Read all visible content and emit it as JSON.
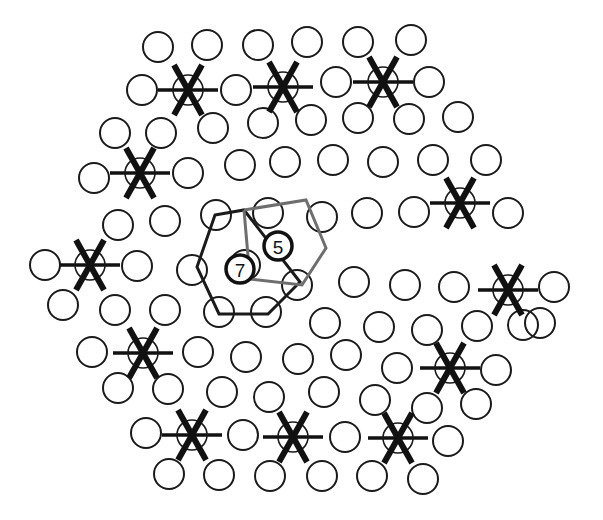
{
  "diagram": {
    "colors": {
      "background": "#ffffff",
      "stroke": "#1a1a1a",
      "gray_hexagon": "#6e6e6e"
    },
    "circle_radius": 15,
    "marked_circles": [
      [
        188,
        90
      ],
      [
        283,
        87
      ],
      [
        383,
        82
      ],
      [
        140,
        173
      ],
      [
        90,
        265
      ],
      [
        143,
        353
      ],
      [
        192,
        435
      ],
      [
        293,
        437
      ],
      [
        398,
        438
      ],
      [
        460,
        203
      ],
      [
        508,
        290
      ],
      [
        450,
        368
      ]
    ],
    "plain_circles": [
      [
        158,
        47
      ],
      [
        207,
        45
      ],
      [
        258,
        45
      ],
      [
        307,
        42
      ],
      [
        358,
        42
      ],
      [
        411,
        40
      ],
      [
        142,
        90
      ],
      [
        236,
        90
      ],
      [
        336,
        82
      ],
      [
        429,
        82
      ],
      [
        161,
        133
      ],
      [
        213,
        128
      ],
      [
        263,
        123
      ],
      [
        311,
        120
      ],
      [
        358,
        118
      ],
      [
        409,
        119
      ],
      [
        458,
        117
      ],
      [
        115,
        133
      ],
      [
        94,
        178
      ],
      [
        188,
        173
      ],
      [
        240,
        165
      ],
      [
        285,
        162
      ],
      [
        333,
        160
      ],
      [
        383,
        162
      ],
      [
        433,
        160
      ],
      [
        486,
        160
      ],
      [
        118,
        225
      ],
      [
        165,
        221
      ],
      [
        216,
        215
      ],
      [
        268,
        213
      ],
      [
        322,
        217
      ],
      [
        367,
        213
      ],
      [
        414,
        212
      ],
      [
        508,
        213
      ],
      [
        45,
        265
      ],
      [
        137,
        266
      ],
      [
        192,
        270
      ],
      [
        245,
        265
      ],
      [
        297,
        285
      ],
      [
        354,
        282
      ],
      [
        405,
        285
      ],
      [
        454,
        287
      ],
      [
        554,
        287
      ],
      [
        63,
        305
      ],
      [
        115,
        310
      ],
      [
        165,
        310
      ],
      [
        219,
        312
      ],
      [
        266,
        312
      ],
      [
        325,
        323
      ],
      [
        379,
        327
      ],
      [
        427,
        330
      ],
      [
        477,
        326
      ],
      [
        523,
        325
      ],
      [
        92,
        352
      ],
      [
        198,
        352
      ],
      [
        246,
        357
      ],
      [
        298,
        359
      ],
      [
        346,
        355
      ],
      [
        397,
        368
      ],
      [
        496,
        370
      ],
      [
        540,
        323
      ],
      [
        118,
        388
      ],
      [
        168,
        389
      ],
      [
        222,
        392
      ],
      [
        269,
        397
      ],
      [
        324,
        392
      ],
      [
        375,
        400
      ],
      [
        427,
        408
      ],
      [
        476,
        404
      ],
      [
        146,
        433
      ],
      [
        243,
        435
      ],
      [
        345,
        437
      ],
      [
        448,
        441
      ],
      [
        169,
        474
      ],
      [
        219,
        475
      ],
      [
        270,
        476
      ],
      [
        322,
        476
      ],
      [
        372,
        476
      ],
      [
        423,
        479
      ]
    ],
    "hexagon_dark": [
      [
        215,
        215
      ],
      [
        244,
        210
      ],
      [
        300,
        282
      ],
      [
        268,
        314
      ],
      [
        219,
        314
      ],
      [
        197,
        267
      ]
    ],
    "hexagon_gray": [
      [
        244,
        210
      ],
      [
        306,
        200
      ],
      [
        326,
        248
      ],
      [
        302,
        285
      ],
      [
        250,
        279
      ],
      [
        244,
        210
      ]
    ],
    "labels": [
      {
        "text": "5",
        "x": 278,
        "y": 246
      },
      {
        "text": "7",
        "x": 240,
        "y": 269
      }
    ]
  }
}
